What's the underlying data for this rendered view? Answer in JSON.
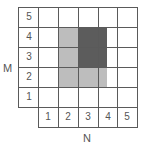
{
  "diagram": {
    "row_axis_label": "M",
    "col_axis_label": "N",
    "row_labels": [
      "5",
      "4",
      "3",
      "2",
      "1"
    ],
    "col_labels": [
      "1",
      "2",
      "3",
      "4",
      "5"
    ],
    "colors": {
      "light_region": "#bdbdbd",
      "dark_region": "#5c5c5c",
      "grid_line": "#5a5a5a"
    },
    "regions": [
      {
        "name": "light-region",
        "cols": "2-4",
        "rows": "2-4"
      },
      {
        "name": "dark-region",
        "cols": "3-4",
        "rows": "3-4"
      }
    ]
  }
}
